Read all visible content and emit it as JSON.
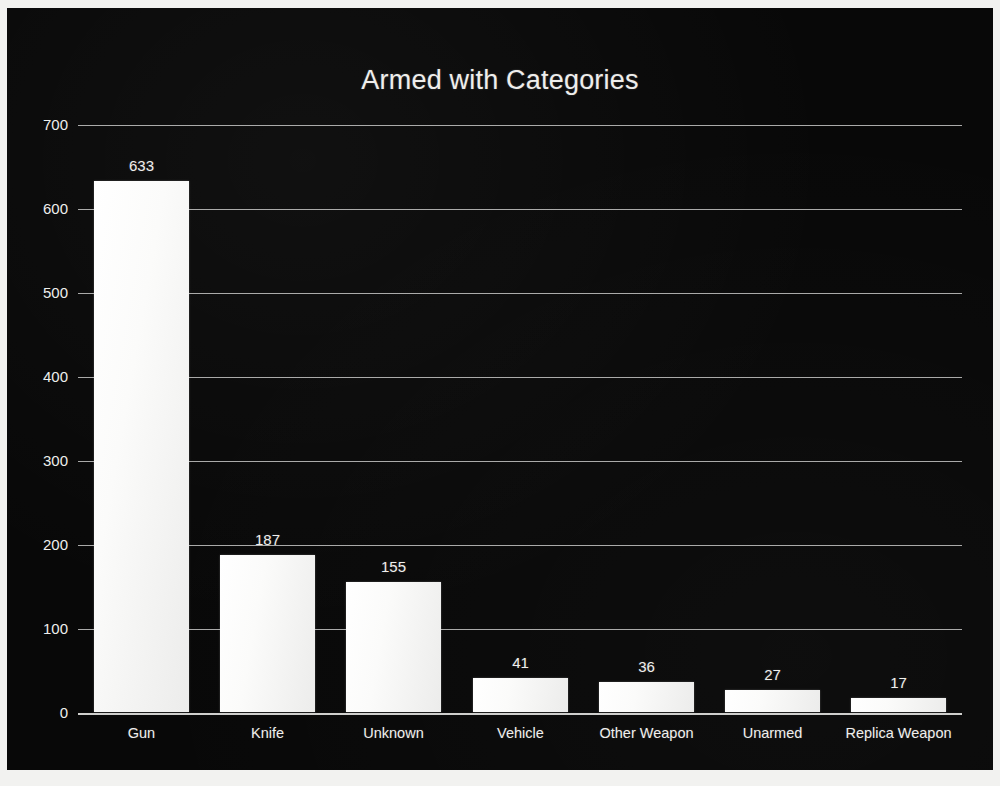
{
  "chart_data": {
    "type": "bar",
    "title": "Armed with Categories",
    "xlabel": "",
    "ylabel": "",
    "categories": [
      "Gun",
      "Knife",
      "Unknown",
      "Vehicle",
      "Other Weapon",
      "Unarmed",
      "Replica Weapon"
    ],
    "values": [
      633,
      187,
      155,
      41,
      36,
      27,
      17
    ],
    "value_labels": [
      "633",
      "187",
      "155",
      "41",
      "36",
      "27",
      "17"
    ],
    "ylim": [
      0,
      700
    ],
    "ytick_values": [
      0,
      100,
      200,
      300,
      400,
      500,
      600,
      700
    ],
    "ytick_labels": [
      "0",
      "100",
      "200",
      "300",
      "400",
      "500",
      "600",
      "700"
    ],
    "grid": true,
    "grid_axis": "y",
    "legend": false,
    "legend_position": "none",
    "data_labels": true,
    "background_color": "#080808",
    "bar_color": "#f7f7f6",
    "grid_color": "#b9b9b7",
    "text_color": "#efeeec",
    "frame_color": "#f2f2f0"
  }
}
